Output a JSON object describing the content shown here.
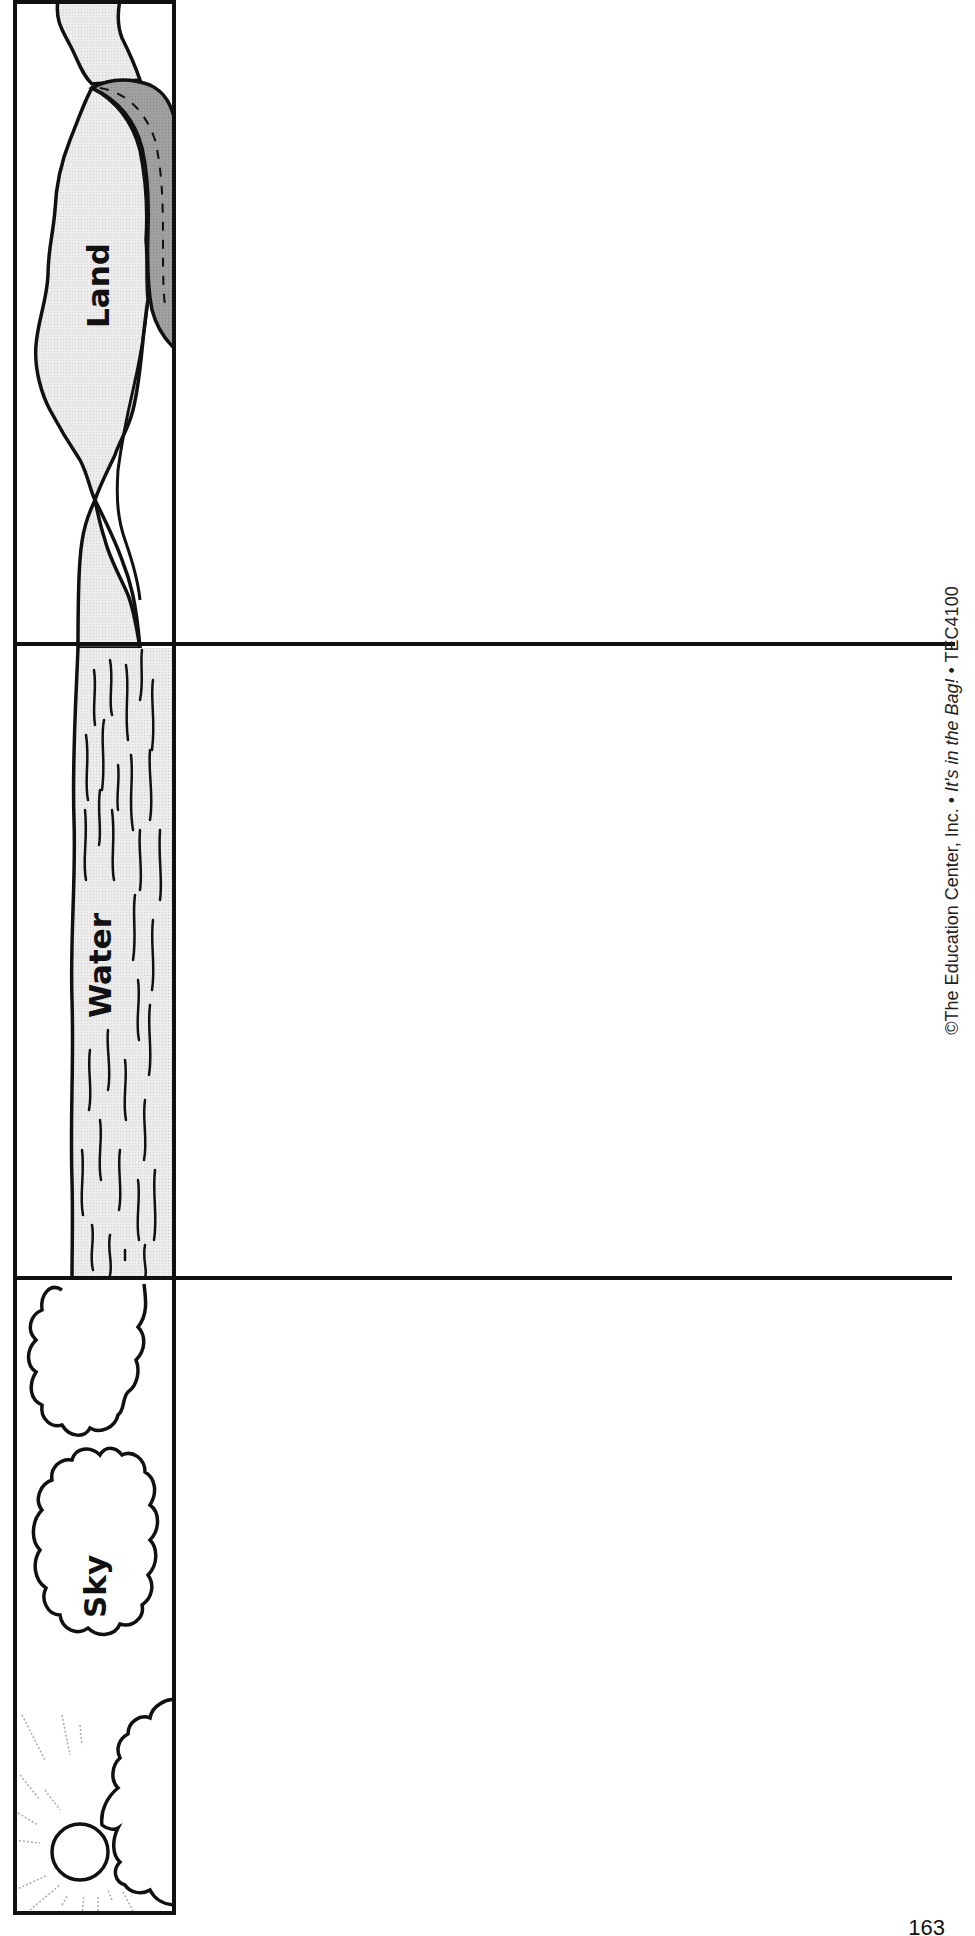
{
  "worksheet": {
    "sections": [
      {
        "id": "land",
        "label": "Land"
      },
      {
        "id": "water",
        "label": "Water"
      },
      {
        "id": "sky",
        "label": "Sky"
      }
    ]
  },
  "footer": {
    "copyright": "©The Education Center, Inc.",
    "separator": "•",
    "title": "It's in the Bag!",
    "code": "TEC4100"
  },
  "page_number": "163",
  "colors": {
    "line": "#111111",
    "land_fill": "#e6e6e6",
    "road_fill": "#9a9a9a",
    "water_fill": "#e0e0e0",
    "sun_ray": "#aaaaaa"
  }
}
